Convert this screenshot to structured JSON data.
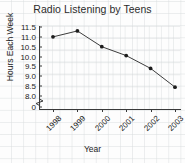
{
  "chart_data": {
    "type": "line",
    "title": "Radio Listening by Teens",
    "xlabel": "Year",
    "ylabel": "Hours Each Week",
    "categories": [
      "1998",
      "1999",
      "2000",
      "2001",
      "2002",
      "2003"
    ],
    "values": [
      11.0,
      11.3,
      10.5,
      10.05,
      9.4,
      8.45
    ],
    "series": [
      {
        "name": "Hours Each Week",
        "values": [
          11.0,
          11.3,
          10.5,
          10.05,
          9.4,
          8.45
        ]
      }
    ],
    "ylim": [
      8.0,
      11.5
    ],
    "ytick_labels": [
      "11.5",
      "11.0",
      "10.5",
      "10.0",
      "9.5",
      "9.0",
      "8.5",
      "8.0",
      "0"
    ],
    "ytick_values": [
      11.5,
      11.0,
      10.5,
      10.0,
      9.5,
      9.0,
      8.5,
      8.0,
      0
    ],
    "y_axis_break": true,
    "grid": true,
    "legend": "none",
    "marker": "filled-circle",
    "line_color": "#3c3c3c",
    "marker_color": "#1d1d1d",
    "background_color": "#fdfdfd",
    "grid_color": "#cdd2d4",
    "axis_color": "#3a3a3a",
    "text_color": "#232323",
    "xtick_label_rotation": -45
  }
}
